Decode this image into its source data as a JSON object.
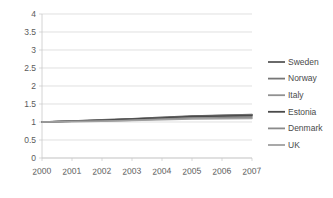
{
  "chart_data": {
    "type": "line",
    "title": "",
    "subtitle": "",
    "xlabel": "",
    "ylabel": "",
    "categories": [
      "2000",
      "2001",
      "2002",
      "2003",
      "2004",
      "2005",
      "2006",
      "2007"
    ],
    "x": [
      2000,
      2001,
      2002,
      2003,
      2004,
      2005,
      2006,
      2007
    ],
    "xlim": [
      2000,
      2007
    ],
    "ylim": [
      0,
      4
    ],
    "y_ticks": [
      "0",
      "0.5",
      "1",
      "1.5",
      "2",
      "2.5",
      "3",
      "3.5",
      "4"
    ],
    "y_tick_values": [
      0,
      0.5,
      1,
      1.5,
      2,
      2.5,
      3,
      3.5,
      4
    ],
    "grid": true,
    "grid_axis": "y",
    "legend_position": "right",
    "series": [
      {
        "name": "Sweden",
        "color": "#5a5a5a",
        "values": [
          1.0,
          1.03,
          1.06,
          1.09,
          1.13,
          1.17,
          1.19,
          1.21
        ]
      },
      {
        "name": "Norway",
        "color": "#767676",
        "values": [
          1.0,
          1.03,
          1.05,
          1.08,
          1.12,
          1.16,
          1.18,
          1.2
        ]
      },
      {
        "name": "Italy",
        "color": "#919191",
        "values": [
          1.0,
          1.02,
          1.04,
          1.07,
          1.1,
          1.13,
          1.15,
          1.16
        ]
      },
      {
        "name": "Estonia",
        "color": "#4a4a4a",
        "values": [
          1.0,
          1.02,
          1.05,
          1.08,
          1.11,
          1.15,
          1.17,
          1.18
        ]
      },
      {
        "name": "Denmark",
        "color": "#8a8a8a",
        "values": [
          1.0,
          1.02,
          1.03,
          1.05,
          1.08,
          1.11,
          1.12,
          1.13
        ]
      },
      {
        "name": "UK",
        "color": "#a0a0a0",
        "values": [
          1.0,
          1.01,
          1.02,
          1.04,
          1.06,
          1.08,
          1.09,
          1.1
        ]
      }
    ]
  },
  "legend": {
    "entries": [
      {
        "label": "Sweden"
      },
      {
        "label": "Norway"
      },
      {
        "label": "Italy"
      },
      {
        "label": "Estonia"
      },
      {
        "label": "Denmark"
      },
      {
        "label": "UK"
      }
    ]
  },
  "axes": {
    "y_labels": [
      "4",
      "3.5",
      "3",
      "2.5",
      "2",
      "1.5",
      "1",
      "0.5",
      "0"
    ],
    "x_labels": [
      "2000",
      "2001",
      "2002",
      "2003",
      "2004",
      "2005",
      "2006",
      "2007"
    ]
  },
  "colors": {
    "grid": "#d2d2d2",
    "axis": "#c9c9c9",
    "text": "#5b5b5b",
    "background": "#ffffff"
  }
}
